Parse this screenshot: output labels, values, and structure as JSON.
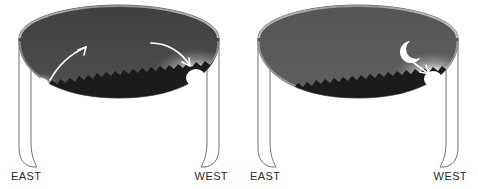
{
  "figure": {
    "background_color": "#ffffff",
    "panel_count": 2
  },
  "panels": [
    {
      "id": "panel-left",
      "name": "sunset-panel",
      "scene": "Sun rising in the east, arcing across the sky and setting in the west",
      "labels": {
        "east": "EAST",
        "west": "WEST"
      },
      "sky": {
        "top_color": "#4a4a4a",
        "horizon_color": "#5e5e5e",
        "rim_color": "#a8a8a8",
        "bowl_interior_color": "#ffffff",
        "outline_color": "#6b6b6b"
      },
      "horizon": {
        "silhouette_color": "#1c1c1c",
        "description": "jagged tree-line silhouette"
      },
      "bodies": [
        {
          "name": "sun-east",
          "type": "sun",
          "glyph": "sun-disc",
          "color": "#ffffff",
          "glow_color": "#d8d8d8",
          "position": "low on eastern horizon"
        },
        {
          "name": "sun-west",
          "type": "sun",
          "glyph": "sun-disc",
          "color": "#ffffff",
          "glow_color": "#efefef",
          "position": "setting on western horizon"
        }
      ],
      "arrows": [
        {
          "name": "arrow-sun-rising",
          "color": "#ffffff",
          "direction": "up-and-right from eastern sun"
        },
        {
          "name": "arrow-sun-setting",
          "color": "#ffffff",
          "direction": "down-and-right toward western sun"
        }
      ]
    },
    {
      "id": "panel-right",
      "name": "crescent-moon-panel",
      "scene": "Thin crescent moon in the western twilight above the set sun",
      "labels": {
        "east": "EAST",
        "west": "WEST"
      },
      "sky": {
        "top_color": "#5a5a5a",
        "horizon_color": "#6e6e6e",
        "rim_color": "#b0b0b0",
        "bowl_interior_color": "#ffffff",
        "outline_color": "#6b6b6b"
      },
      "horizon": {
        "silhouette_color": "#1c1c1c",
        "description": "jagged tree-line silhouette"
      },
      "bodies": [
        {
          "name": "crescent-moon",
          "type": "moon",
          "glyph": "crescent",
          "color": "#ffffff",
          "position": "above western horizon"
        },
        {
          "name": "sun-glow-west",
          "type": "sun-glow",
          "glyph": "glow-disc",
          "color": "#ffffff",
          "glow_color": "#e8e8e8",
          "position": "just below western horizon"
        }
      ],
      "arrows": [
        {
          "name": "arrow-moon-to-sun",
          "color": "#ffffff",
          "direction": "down-and-right from moon to sun glow"
        }
      ]
    }
  ]
}
